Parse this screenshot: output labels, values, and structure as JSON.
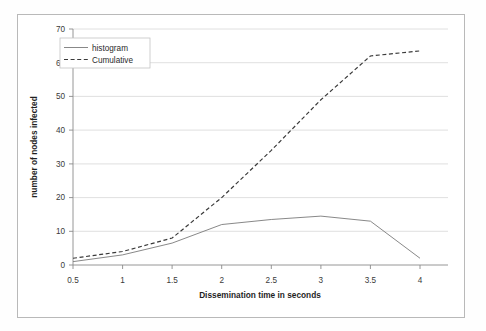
{
  "chart_data": {
    "type": "line",
    "title": "",
    "xlabel": "Dissemination time in seconds",
    "ylabel": "number of nodes infected",
    "x": [
      0.5,
      1,
      1.5,
      2,
      2.5,
      3,
      3.5,
      4
    ],
    "xticklabels": [
      "0.5",
      "1",
      "1.5",
      "2",
      "2.5",
      "3",
      "3.5",
      "4"
    ],
    "yticklabels": [
      "0",
      "10",
      "20",
      "30",
      "40",
      "50",
      "60",
      "70"
    ],
    "xlim": [
      0.5,
      4
    ],
    "ylim": [
      0,
      70
    ],
    "grid": "horizontal",
    "legend_position": "upper-left-inside",
    "series": [
      {
        "name": "histogram",
        "style": "solid",
        "color": "#7a7a7a",
        "values": [
          1,
          3,
          6.5,
          12,
          13.5,
          14.5,
          13,
          2
        ]
      },
      {
        "name": "Cumulative",
        "style": "dashed",
        "color": "#3a3a3a",
        "values": [
          2,
          4,
          8,
          20,
          34,
          49,
          62,
          63.5
        ]
      }
    ]
  },
  "legend": {
    "items": [
      {
        "label": "histogram"
      },
      {
        "label": "Cumulative"
      }
    ]
  },
  "axes": {
    "x_title": "Dissemination time in seconds",
    "y_title": "number of nodes infected"
  },
  "colors": {
    "frame": "#b9b9b9",
    "grid": "#d8d8d8",
    "axis": "#8a8a8a",
    "histogram": "#7a7a7a",
    "cumulative": "#3a3a3a"
  }
}
